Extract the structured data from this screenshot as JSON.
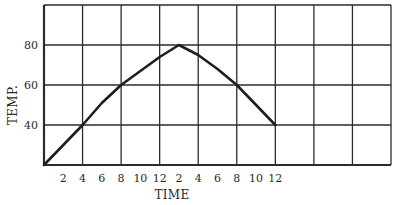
{
  "chart_data": {
    "type": "line",
    "title": "",
    "xlabel": "TIME",
    "ylabel": "TEMP.",
    "x_tick_labels": [
      "2",
      "4",
      "6",
      "8",
      "10",
      "12",
      "2",
      "4",
      "6",
      "8",
      "10",
      "12"
    ],
    "x_hours": [
      2,
      4,
      6,
      8,
      10,
      12,
      14,
      16,
      18,
      20,
      22,
      24
    ],
    "y_tick_labels": [
      "40",
      "60",
      "80"
    ],
    "y_ticks": [
      40,
      60,
      80
    ],
    "xlim": [
      0,
      36
    ],
    "ylim": [
      20,
      100
    ],
    "grid": true,
    "legend": null,
    "series": [
      {
        "name": "Temperature",
        "x": [
          0,
          4,
          6,
          8,
          10,
          12,
          14,
          16,
          18,
          20,
          22,
          24
        ],
        "y": [
          20,
          40,
          51,
          60,
          67,
          74,
          80,
          75,
          68,
          60,
          50,
          40
        ]
      }
    ]
  }
}
